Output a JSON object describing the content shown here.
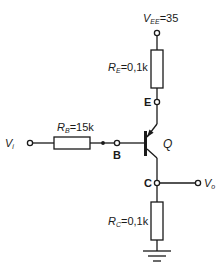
{
  "circuit": {
    "supply": {
      "symbol": "V",
      "sub": "EE",
      "value": "=35"
    },
    "input": {
      "symbol": "V",
      "sub": "i"
    },
    "output": {
      "symbol": "V",
      "sub": "o"
    },
    "transistor": {
      "name": "Q",
      "type": "PNP"
    },
    "nodes": {
      "emitter": "E",
      "base": "B",
      "collector": "C"
    },
    "resistors": {
      "RE": {
        "symbol": "R",
        "sub": "E",
        "value": "=0,1k"
      },
      "RB": {
        "symbol": "R",
        "sub": "B",
        "value": "=15k"
      },
      "RC": {
        "symbol": "R",
        "sub": "C",
        "value": "=0,1k"
      }
    },
    "colors": {
      "line": "#1a1a1a",
      "background": "#ffffff"
    }
  }
}
